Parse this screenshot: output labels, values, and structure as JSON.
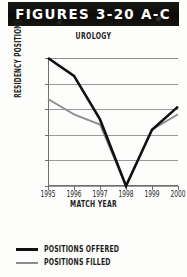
{
  "banner": {
    "label": "FIGURES 3-20 A-C"
  },
  "legend": {
    "items": [
      {
        "name": "POSITIONS OFFERED",
        "color": "#111111"
      },
      {
        "name": "POSITIONS FILLED",
        "color": "#8d8d8d"
      }
    ]
  },
  "chart_data": {
    "type": "line",
    "title": "UROLOGY",
    "xlabel": "MATCH YEAR",
    "ylabel": "RESIDENCY POSITIONS",
    "categories": [
      "1995",
      "1996",
      "1997",
      "1998",
      "1999",
      "2000"
    ],
    "ylim": [
      200,
      250
    ],
    "yticks": [
      250,
      240,
      230,
      220,
      210,
      200
    ],
    "grid": true,
    "legend_position": "below",
    "series": [
      {
        "name": "POSITIONS OFFERED",
        "color": "#111111",
        "values": [
          250,
          243,
          226,
          200,
          222,
          231
        ]
      },
      {
        "name": "POSITIONS FILLED",
        "color": "#8d8d8d",
        "values": [
          234,
          228,
          224,
          200,
          222,
          228
        ]
      }
    ]
  }
}
